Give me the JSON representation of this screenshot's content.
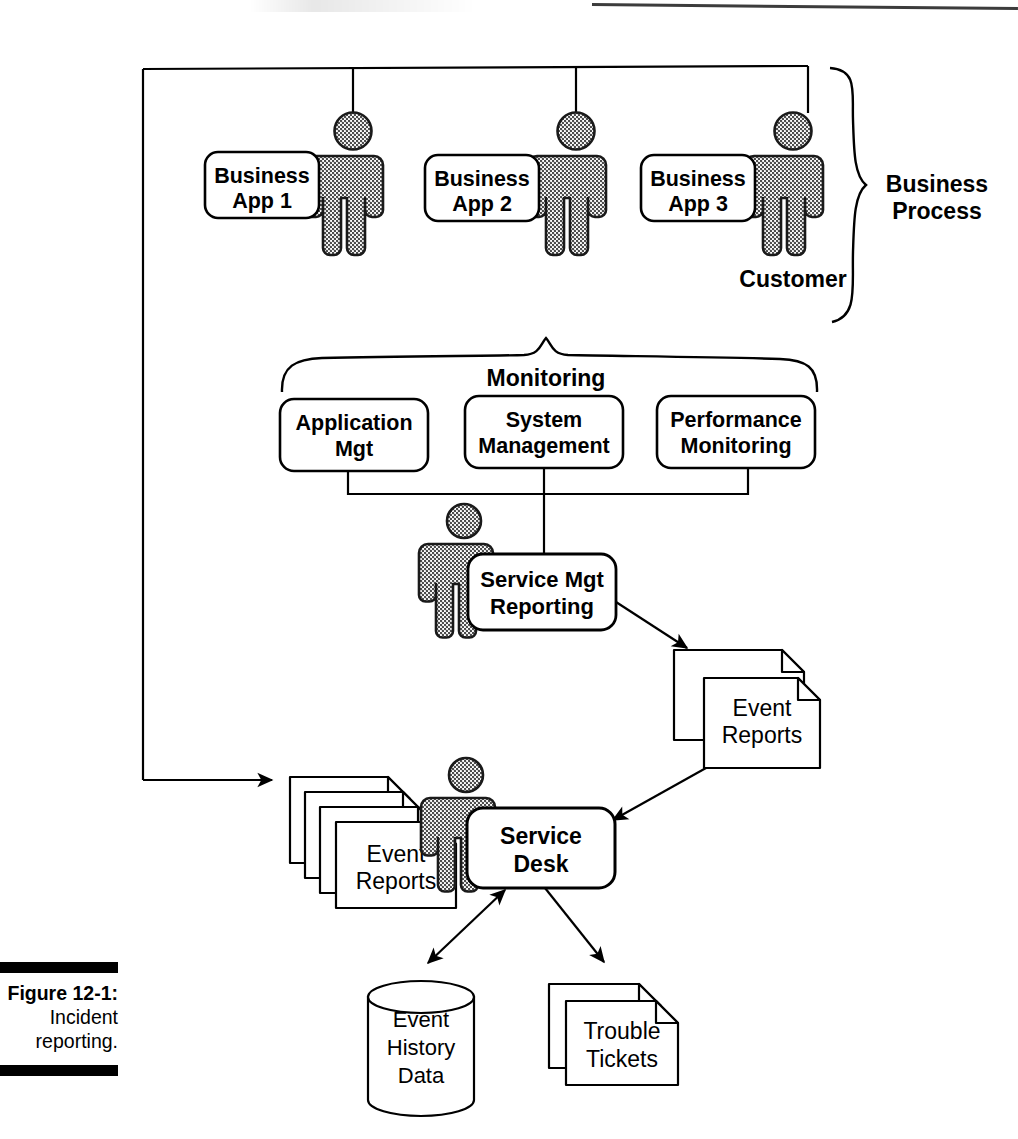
{
  "figure": {
    "caption_number": "Figure 12-1:",
    "caption_line2": "Incident",
    "caption_line3": "reporting.",
    "title": "Incident reporting"
  },
  "groups": {
    "business_process": {
      "label_line1": "Business",
      "label_line2": "Process"
    },
    "monitoring": {
      "label": "Monitoring"
    }
  },
  "nodes": {
    "business_app_1": {
      "line1": "Business",
      "line2": "App 1"
    },
    "business_app_2": {
      "line1": "Business",
      "line2": "App 2"
    },
    "business_app_3": {
      "line1": "Business",
      "line2": "App 3"
    },
    "customer": {
      "label": "Customer"
    },
    "application_mgt": {
      "line1": "Application",
      "line2": "Mgt"
    },
    "system_management": {
      "line1": "System",
      "line2": "Management"
    },
    "performance_monitoring": {
      "line1": "Performance",
      "line2": "Monitoring"
    },
    "service_mgt_reporting": {
      "line1": "Service Mgt",
      "line2": "Reporting"
    },
    "service_desk": {
      "line1": "Service",
      "line2": "Desk"
    },
    "event_reports_right": {
      "line1": "Event",
      "line2": "Reports"
    },
    "event_reports_left": {
      "line1": "Event",
      "line2": "Reports"
    },
    "event_history_data": {
      "line1": "Event",
      "line2": "History",
      "line3": "Data"
    },
    "trouble_tickets": {
      "line1": "Trouble",
      "line2": "Tickets"
    }
  },
  "colors": {
    "stroke": "#000000",
    "figure_fill": "#8c8c8c",
    "figure_outline": "#1a1a1a",
    "paper": "#ffffff",
    "caption_bar": "#000000"
  }
}
